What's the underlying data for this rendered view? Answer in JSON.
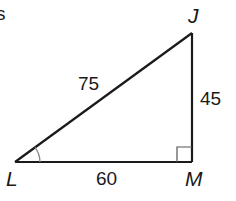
{
  "figure": {
    "type": "right-triangle",
    "cropped_text_fragment": "s",
    "vertices": [
      {
        "label": "L",
        "x": 15,
        "y": 162
      },
      {
        "label": "J",
        "x": 192,
        "y": 33
      },
      {
        "label": "M",
        "x": 192,
        "y": 162
      }
    ],
    "sides": [
      {
        "name": "LJ",
        "label": "75"
      },
      {
        "name": "JM",
        "label": "45"
      },
      {
        "name": "LM",
        "label": "60"
      }
    ],
    "right_angle_at": "M",
    "marked_angle_at": "L",
    "colors": {
      "stroke": "#1a1a1a",
      "angle_arc": "#888888",
      "right_angle_box": "#555555"
    }
  }
}
